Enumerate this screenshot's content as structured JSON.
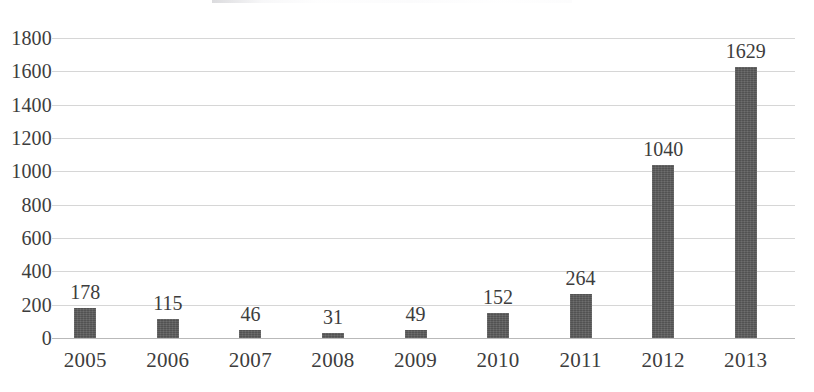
{
  "chart_data": {
    "type": "bar",
    "title": "",
    "subtitle": "",
    "xlabel": "",
    "ylabel": "",
    "categories": [
      "2005",
      "2006",
      "2007",
      "2008",
      "2009",
      "2010",
      "2011",
      "2012",
      "2013"
    ],
    "values": [
      178,
      115,
      46,
      31,
      49,
      152,
      264,
      1040,
      1629
    ],
    "data_labels": [
      "178",
      "115",
      "46",
      "31",
      "49",
      "152",
      "264",
      "1040",
      "1629"
    ],
    "ylim": [
      0,
      1800
    ],
    "ytick_labels": [
      "1800",
      "1600",
      "1400",
      "1200",
      "1000",
      "800",
      "600",
      "400",
      "200",
      "0"
    ],
    "ytick_values": [
      1800,
      1600,
      1400,
      1200,
      1000,
      800,
      600,
      400,
      200,
      0
    ],
    "grid": true,
    "grid_axis": "y",
    "legend": false,
    "legend_position": "none",
    "series": [
      {
        "name": "",
        "values": [
          178,
          115,
          46,
          31,
          49,
          152,
          264,
          1040,
          1629
        ],
        "color": "#595959"
      }
    ],
    "colors": {
      "bar": "#595959",
      "gridline": "#d6d6d6",
      "axis": "#b9b9b9",
      "text": "#3d3d3d",
      "background": "#ffffff"
    }
  }
}
